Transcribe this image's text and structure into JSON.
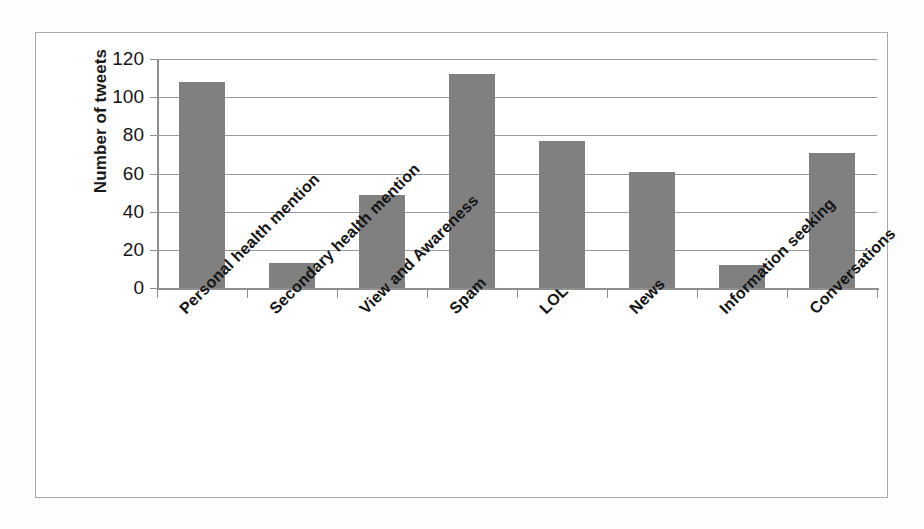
{
  "chart_data": {
    "type": "bar",
    "title": "",
    "xlabel": "",
    "ylabel": "Number of tweets",
    "categories": [
      "Personal health mention",
      "Secondary health mention",
      "View and Awareness",
      "Spam",
      "LOL",
      "News",
      "Information seeking",
      "Conversations"
    ],
    "values": [
      108,
      13,
      49,
      112,
      77,
      61,
      12,
      71
    ],
    "ylim": [
      0,
      120
    ],
    "yticks": [
      0,
      20,
      40,
      60,
      80,
      100,
      120
    ],
    "ytick_labels": [
      "0",
      "20",
      "40",
      "60",
      "80",
      "100",
      "120"
    ],
    "grid": true,
    "legend": false,
    "bar_color": "#808080",
    "axis_color": "#8f8f8f",
    "frame_color": "#a9a9a9",
    "text_color": "#161616"
  },
  "axis": {
    "y_title": "Number of tweets"
  }
}
